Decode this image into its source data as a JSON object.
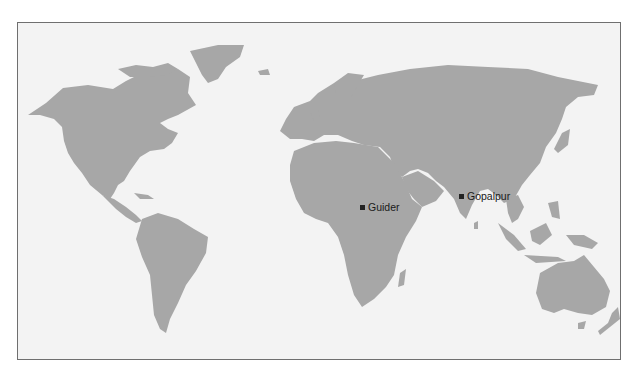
{
  "map": {
    "type": "world-map",
    "colors": {
      "land": "#a7a7a7",
      "ocean": "#f3f3f3",
      "border": "#6f6f6f",
      "marker": "#222222"
    },
    "markers": [
      {
        "name": "Guider",
        "x": 346,
        "y": 185
      },
      {
        "name": "Gopalpur",
        "x": 445,
        "y": 174
      }
    ]
  }
}
